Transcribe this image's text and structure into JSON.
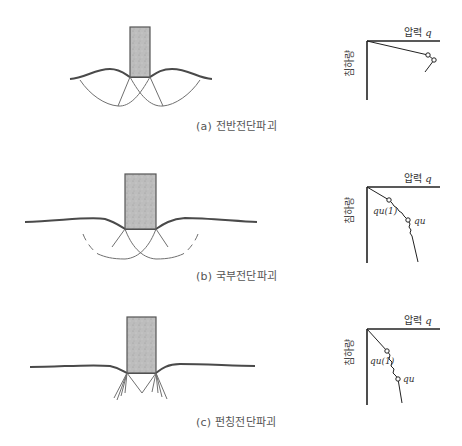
{
  "figures": [
    {
      "id": "a",
      "caption": "(a) 전반전단파괴",
      "graph": {
        "x_axis_title": "압력",
        "x_axis_symbol": "q",
        "y_axis_title": "침하량",
        "point_labels": []
      }
    },
    {
      "id": "b",
      "caption": "(b) 국부전단파괴",
      "graph": {
        "x_axis_title": "압력",
        "x_axis_symbol": "q",
        "y_axis_title": "침하량",
        "point_labels": [
          "qu(1)",
          "qu"
        ]
      }
    },
    {
      "id": "c",
      "caption": "(c) 펀칭전단파괴",
      "graph": {
        "x_axis_title": "압력",
        "x_axis_symbol": "q",
        "y_axis_title": "침하량",
        "point_labels": [
          "qu(1)",
          "qu"
        ]
      }
    }
  ],
  "colors": {
    "footing_fill": "#b9b9b9",
    "footing_stroke": "#555555",
    "ground_line": "#4a4a4a",
    "slip_line": "#6a6a6a",
    "axis": "#222222"
  }
}
